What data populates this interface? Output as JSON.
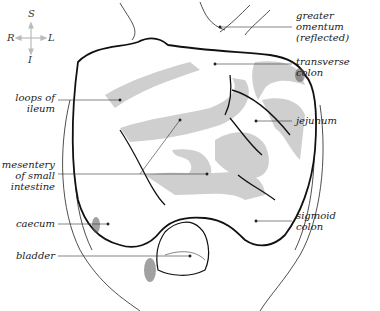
{
  "figure": {
    "colors": {
      "outline": "#111111",
      "intestine_fill": "#cfcfcf",
      "shading": "#888888",
      "compass": "#bbbbbb"
    }
  },
  "compass": {
    "superior": "S",
    "inferior": "I",
    "right": "R",
    "left": "L"
  },
  "labels": {
    "left": [
      {
        "id": "loops-of-ileum",
        "text": "loops of\nileum"
      },
      {
        "id": "mesentery",
        "text": "mesentery\nof small\nintestine"
      },
      {
        "id": "caecum",
        "text": "caecum"
      },
      {
        "id": "bladder",
        "text": "bladder"
      }
    ],
    "right": [
      {
        "id": "greater-omentum",
        "text": "greater\nomentum\n(reflected)"
      },
      {
        "id": "transverse-colon",
        "text": "transverse\ncolon"
      },
      {
        "id": "jejunum",
        "text": "jejunum"
      },
      {
        "id": "sigmoid-colon",
        "text": "sigmoid\ncolon"
      }
    ]
  }
}
